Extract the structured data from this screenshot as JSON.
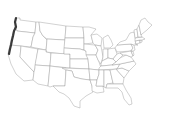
{
  "map": {
    "type": "choropleth-outline",
    "region": "United States (contiguous)",
    "background_color": "#ffffff",
    "border_color": "#9a9a9a",
    "highlight_color": "#3a3a3a",
    "highlighted_feature": "Pacific coastline (Washington, Oregon, northern California)"
  }
}
